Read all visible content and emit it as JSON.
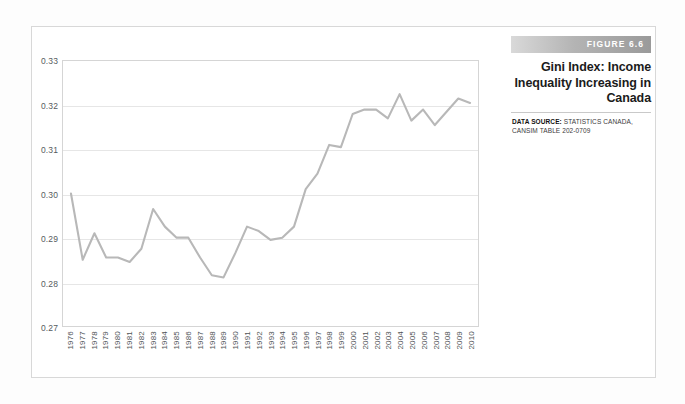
{
  "figure": {
    "banner_label": "FIGURE 6.6",
    "title_line_1": "Gini Index: Income",
    "title_line_2": "Inequality Increasing in",
    "title_line_3": "Canada",
    "data_source_label": "DATA SOURCE:",
    "data_source_text": " STATISTICS CANADA, CANSIM TABLE 202-0709"
  },
  "chart_data": {
    "type": "line",
    "title": "Gini Index: Income Inequality Increasing in Canada",
    "xlabel": "",
    "ylabel": "",
    "ylim": [
      0.27,
      0.33
    ],
    "ytick_values": [
      0.33,
      0.32,
      0.31,
      0.3,
      0.29,
      0.28,
      0.27
    ],
    "ytick_labels": [
      "0.33",
      "0.32",
      "0.31",
      "0.30",
      "0.29",
      "0.28",
      "0.27"
    ],
    "grid": true,
    "legend": false,
    "line_color": "#b8b8b8",
    "categories": [
      "1976",
      "1977",
      "1978",
      "1979",
      "1980",
      "1981",
      "1982",
      "1983",
      "1984",
      "1985",
      "1986",
      "1987",
      "1988",
      "1989",
      "1990",
      "1991",
      "1992",
      "1993",
      "1994",
      "1995",
      "1996",
      "1997",
      "1998",
      "1999",
      "2000",
      "2001",
      "2002",
      "2003",
      "2004",
      "2005",
      "2006",
      "2007",
      "2008",
      "2009",
      "2010"
    ],
    "values": [
      0.3,
      0.285,
      0.291,
      0.2855,
      0.2855,
      0.2845,
      0.2875,
      0.2965,
      0.2925,
      0.29,
      0.29,
      0.2855,
      0.2815,
      0.281,
      0.2865,
      0.2925,
      0.2915,
      0.2895,
      0.29,
      0.2925,
      0.301,
      0.3045,
      0.311,
      0.3105,
      0.318,
      0.319,
      0.319,
      0.317,
      0.3225,
      0.3165,
      0.319,
      0.3155,
      0.3185,
      0.3215,
      0.3205
    ]
  }
}
